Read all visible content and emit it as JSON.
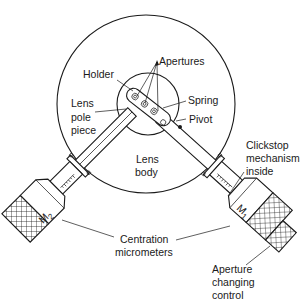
{
  "diagram": {
    "type": "technical-illustration",
    "labels": {
      "apertures": "Apertures",
      "holder": "Holder",
      "lens_pole_piece_1": "Lens",
      "lens_pole_piece_2": "pole",
      "lens_pole_piece_3": "piece",
      "spring": "Spring",
      "pivot": "Pivot",
      "lens_body_1": "Lens",
      "lens_body_2": "body",
      "clickstop_1": "Clickstop",
      "clickstop_2": "mechanism",
      "clickstop_3": "inside",
      "centration_1": "Centration",
      "centration_2": "micrometers",
      "aperture_control_1": "Aperture",
      "aperture_control_2": "changing",
      "aperture_control_3": "control",
      "m2_main": "M",
      "m2_sub": "2",
      "m1_main": "M",
      "m1_sub": "1"
    },
    "colors": {
      "line": "#1a1a1a",
      "background": "#ffffff"
    }
  }
}
